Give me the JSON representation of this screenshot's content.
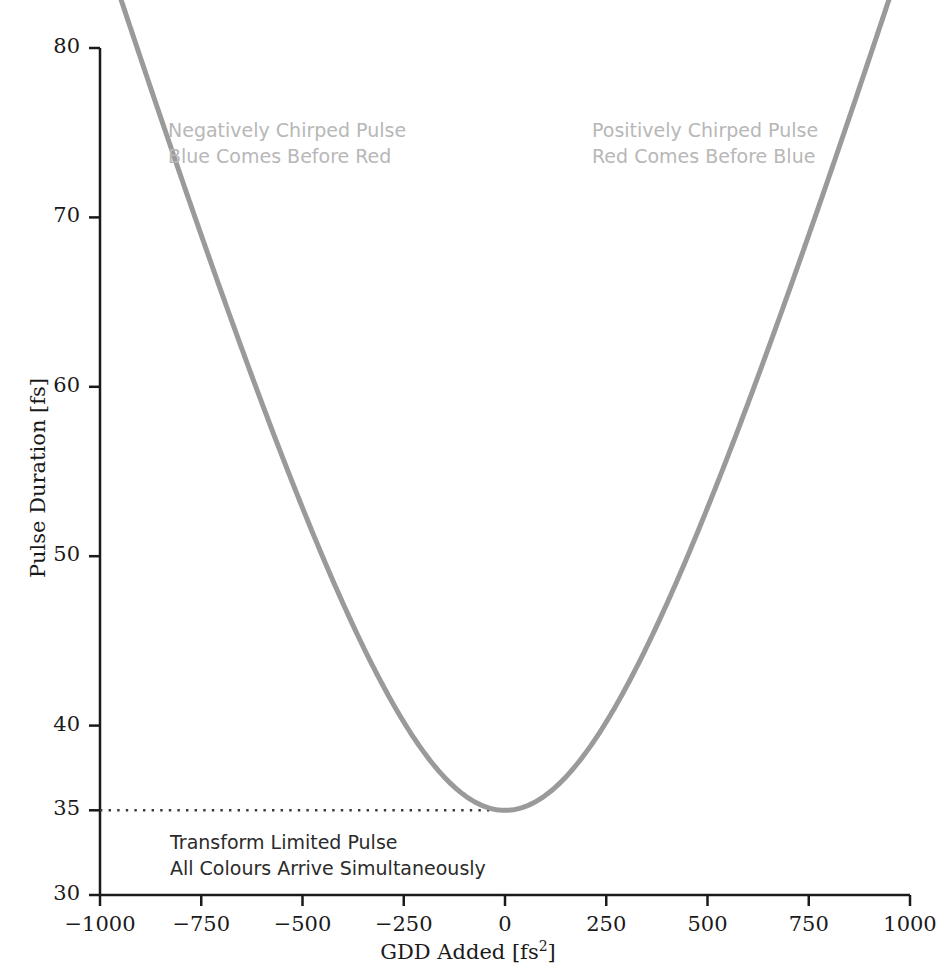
{
  "chart_data": {
    "type": "line",
    "title": "",
    "xlabel": "GDD Added [fs2]",
    "xlabel_base": "GDD Added [fs",
    "xlabel_sup": "2",
    "xlabel_tail": "]",
    "ylabel": "Pulse Duration [fs]",
    "xlim": [
      -1000,
      1000
    ],
    "ylim": [
      30,
      80
    ],
    "xticks": [
      -1000,
      -750,
      -500,
      -250,
      0,
      250,
      500,
      750,
      1000
    ],
    "xtick_labels": [
      "−1000",
      "−750",
      "−500",
      "−250",
      "0",
      "250",
      "500",
      "750",
      "1000"
    ],
    "yticks": [
      30,
      35,
      40,
      50,
      60,
      70,
      80
    ],
    "ytick_labels": [
      "30",
      "35",
      "40",
      "50",
      "60",
      "70",
      "80"
    ],
    "grid": false,
    "legend": null,
    "series": [
      {
        "name": "Pulse Duration vs GDD",
        "color": "#9a9a9a",
        "line_width": 5,
        "transform_limited_duration": 35,
        "x": [
          -1000,
          -950,
          -900,
          -850,
          -800,
          -750,
          -700,
          -650,
          -600,
          -550,
          -500,
          -450,
          -400,
          -350,
          -300,
          -250,
          -200,
          -150,
          -100,
          -50,
          0,
          50,
          100,
          150,
          200,
          250,
          300,
          350,
          400,
          450,
          500,
          550,
          600,
          650,
          700,
          750,
          800,
          850,
          900,
          950,
          1000
        ],
        "values": [
          85.1,
          81.6,
          78.2,
          74.8,
          71.4,
          68.0,
          64.7,
          61.4,
          58.2,
          55.0,
          51.8,
          48.7,
          45.8,
          42.9,
          40.2,
          37.7,
          36.6,
          35.8,
          35.4,
          35.1,
          35.0,
          35.1,
          35.4,
          35.8,
          36.6,
          37.7,
          40.2,
          42.9,
          45.8,
          48.7,
          51.8,
          55.0,
          58.2,
          61.4,
          64.7,
          68.0,
          71.4,
          74.8,
          78.2,
          81.6,
          85.1
        ]
      }
    ],
    "reference_line": {
      "name": "transform-limited-level",
      "orientation": "horizontal",
      "y": 35,
      "style": "dotted",
      "color": "#3a3a3a",
      "x_start": -1000,
      "x_end": 0
    },
    "annotations": [
      {
        "id": "negative",
        "lines": [
          "Negatively Chirped Pulse",
          "Blue Comes Before Red"
        ],
        "color": "#b7b7b7"
      },
      {
        "id": "positive",
        "lines": [
          "Positively Chirped Pulse",
          "Red Comes Before Blue"
        ],
        "color": "#b7b7b7"
      },
      {
        "id": "transform",
        "lines": [
          "Transform Limited Pulse",
          "All Colours Arrive Simultaneously"
        ],
        "color": "#2b2b2b"
      }
    ]
  },
  "axes": {
    "x_title_base": "GDD Added [fs",
    "x_title_sup": "2",
    "x_title_tail": "]",
    "y_title": "Pulse Duration [fs]",
    "xtick_labels": [
      "−1000",
      "−750",
      "−500",
      "−250",
      "0",
      "250",
      "500",
      "750",
      "1000"
    ],
    "ytick_labels": [
      "30",
      "35",
      "40",
      "50",
      "60",
      "70",
      "80"
    ],
    "axis_color": "#1a1a1a"
  },
  "annotations": {
    "negative_line1": "Negatively Chirped Pulse",
    "negative_line2": "Blue Comes Before Red",
    "positive_line1": "Positively Chirped Pulse",
    "positive_line2": "Red Comes Before Blue",
    "transform_line1": "Transform Limited Pulse",
    "transform_line2": "All Colours Arrive Simultaneously"
  },
  "colors": {
    "curve": "#9a9a9a",
    "axis": "#1a1a1a",
    "annotation_light": "#b7b7b7",
    "annotation_dark": "#2b2b2b",
    "background": "#ffffff"
  }
}
